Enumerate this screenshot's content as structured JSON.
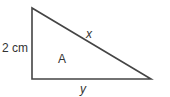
{
  "diagram": {
    "type": "right-triangle",
    "vertices": {
      "top": [
        32,
        8
      ],
      "bottom_left": [
        32,
        79
      ],
      "bottom_right": [
        151,
        79
      ]
    },
    "labels": {
      "left_side": "2 cm",
      "hypotenuse": "x",
      "area": "A",
      "base": "y"
    },
    "stroke_color": "#444444"
  }
}
